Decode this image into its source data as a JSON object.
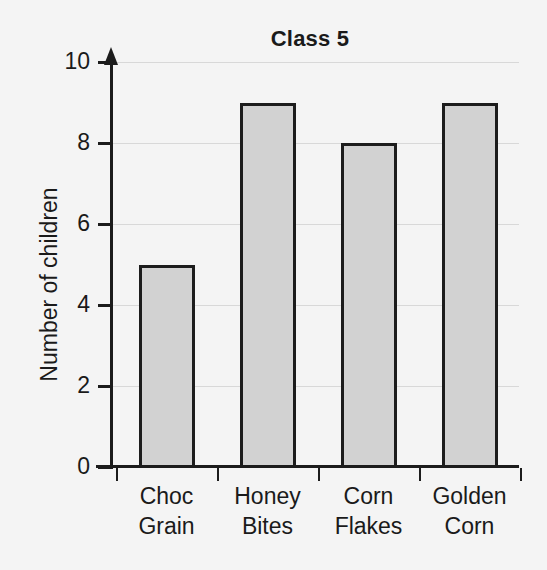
{
  "chart_data": {
    "type": "bar",
    "title": "Class 5",
    "xlabel": "",
    "ylabel": "Number of children",
    "categories": [
      "Choc Grain",
      "Honey Bites",
      "Corn Flakes",
      "Golden Corn"
    ],
    "category_lines": [
      [
        "Choc",
        "Grain"
      ],
      [
        "Honey",
        "Bites"
      ],
      [
        "Corn",
        "Flakes"
      ],
      [
        "Golden",
        "Corn"
      ]
    ],
    "values": [
      5,
      9,
      8,
      9
    ],
    "ylim": [
      0,
      10
    ],
    "ytick_labels": [
      "0",
      "2",
      "4",
      "6",
      "8",
      "10"
    ],
    "ytick_values": [
      0,
      2,
      4,
      6,
      8,
      10
    ],
    "grid": true,
    "legend": false,
    "bar_fill_color": "#d2d2d2",
    "bar_edge_color": "#1c1c1c",
    "background_color": "#f4f4f4",
    "gridline_color": "#d8d8d8",
    "text_color": "#1a1a1a"
  },
  "axes": {
    "y_axis_arrow": "arrow-up-icon",
    "x_axis_tick_count": 5
  }
}
